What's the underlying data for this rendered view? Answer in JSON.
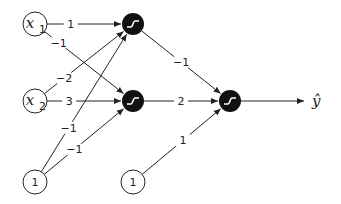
{
  "diagram": {
    "type": "neural-network",
    "inputs": [
      {
        "id": "x1",
        "label": "x",
        "sub": "1"
      },
      {
        "id": "x2",
        "label": "x",
        "sub": "2"
      },
      {
        "id": "b1",
        "label": "1",
        "sub": ""
      }
    ],
    "hidden": [
      {
        "id": "h1",
        "activation": "sigmoid"
      },
      {
        "id": "h2",
        "activation": "sigmoid"
      }
    ],
    "output_bias": {
      "id": "b2",
      "label": "1"
    },
    "output": {
      "id": "o",
      "activation": "sigmoid",
      "label": "ŷ"
    },
    "edges": [
      {
        "from": "x1",
        "to": "h1",
        "weight": "1"
      },
      {
        "from": "x1",
        "to": "h2",
        "weight": "−1"
      },
      {
        "from": "x2",
        "to": "h1",
        "weight": "−2"
      },
      {
        "from": "x2",
        "to": "h2",
        "weight": "3"
      },
      {
        "from": "b1",
        "to": "h1",
        "weight": "−1"
      },
      {
        "from": "b1",
        "to": "h2",
        "weight": "−1"
      },
      {
        "from": "h1",
        "to": "o",
        "weight": "−1"
      },
      {
        "from": "h2",
        "to": "o",
        "weight": "2"
      },
      {
        "from": "b2",
        "to": "o",
        "weight": "1"
      }
    ]
  }
}
